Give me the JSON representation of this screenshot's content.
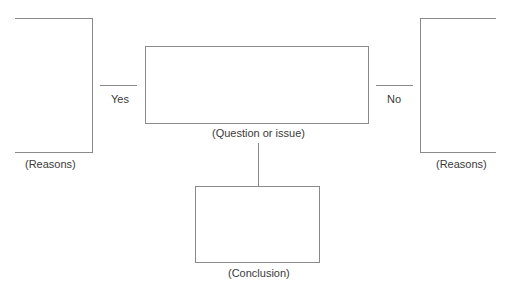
{
  "diagram": {
    "type": "decision-map",
    "center_box": {
      "label": "(Question or issue)"
    },
    "left_branch": {
      "connector_label": "Yes",
      "box_label": "(Reasons)"
    },
    "right_branch": {
      "connector_label": "No",
      "box_label": "(Reasons)"
    },
    "bottom_box": {
      "label": "(Conclusion)"
    },
    "colors": {
      "stroke": "#8a8a8a",
      "text": "#3a3a3a",
      "background": "#ffffff"
    }
  }
}
